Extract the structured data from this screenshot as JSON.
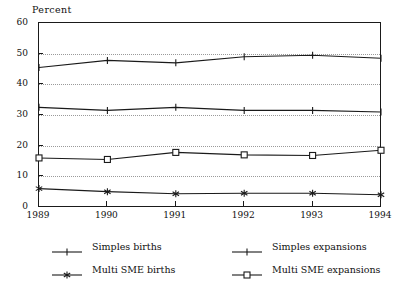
{
  "chart_data": {
    "type": "line",
    "title": "",
    "ylabel": "Percent",
    "xlabel": "",
    "ylim": [
      0,
      60
    ],
    "yticks": [
      0,
      10,
      20,
      30,
      40,
      50,
      60
    ],
    "grid": true,
    "legend_position": "bottom",
    "categories": [
      "1989",
      "1990",
      "1991",
      "1992",
      "1993",
      "1994"
    ],
    "series": [
      {
        "name": "Simples expansions",
        "marker": "plus",
        "values": [
          45.5,
          47.8,
          47.0,
          49.0,
          49.5,
          48.5
        ]
      },
      {
        "name": "Simples births",
        "marker": "plus",
        "values": [
          32.5,
          31.5,
          32.5,
          31.5,
          31.5,
          31.0
        ]
      },
      {
        "name": "Multi SME expansions",
        "marker": "square",
        "values": [
          16.0,
          15.5,
          17.8,
          17.0,
          16.8,
          18.5
        ]
      },
      {
        "name": "Multi SME births",
        "marker": "star",
        "values": [
          6.0,
          5.0,
          4.3,
          4.5,
          4.5,
          4.0
        ]
      }
    ]
  },
  "legend": {
    "entries": [
      {
        "label": "Simples births",
        "marker": "plus",
        "column": "left",
        "row": 0
      },
      {
        "label": "Multi SME births",
        "marker": "star",
        "column": "left",
        "row": 1
      },
      {
        "label": "Simples expansions",
        "marker": "plus",
        "column": "right",
        "row": 0
      },
      {
        "label": "Multi SME expansions",
        "marker": "square",
        "column": "right",
        "row": 1
      }
    ]
  },
  "colors": {
    "line": "#1a1a1a",
    "grid": "#9a9a9a",
    "axis": "#1a1a1a",
    "background": "#ffffff"
  }
}
